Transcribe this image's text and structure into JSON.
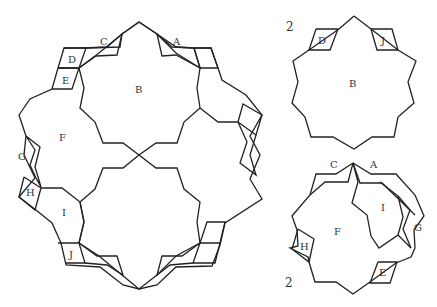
{
  "main_figure": {
    "labels": {
      "A": "A",
      "B": "B",
      "C": "C",
      "D": "D",
      "E": "E",
      "F": "F",
      "G": "G",
      "H": "H",
      "I": "I",
      "J": "J"
    }
  },
  "piece_top": {
    "count": "2",
    "labels": {
      "B": "B",
      "D": "D",
      "J": "J"
    }
  },
  "piece_bottom": {
    "count": "2",
    "labels": {
      "A": "A",
      "C": "C",
      "E": "E",
      "F": "F",
      "G": "G",
      "H": "H",
      "I": "I"
    }
  }
}
